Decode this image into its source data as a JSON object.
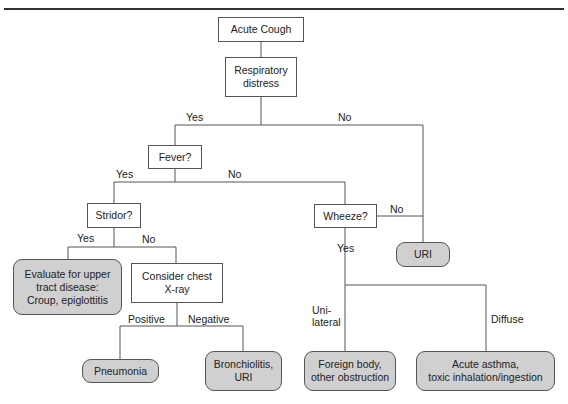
{
  "title": "Acute Cough",
  "nodes": {
    "acute_cough": "Acute Cough",
    "respiratory_distress": "Respiratory\ndistress",
    "fever": "Fever?",
    "stridor": "Stridor?",
    "wheeze": "Wheeze?",
    "uri": "URI",
    "evaluate_upper": "Evaluate for upper\ntract disease:\nCroup, epiglottitis",
    "consider_xray": "Consider chest\nX-ray",
    "pneumonia": "Pneumonia",
    "bronchiolitis": "Bronchiolitis,\nURI",
    "foreign_body": "Foreign body,\nother obstruction",
    "acute_asthma": "Acute asthma,\ntoxic inhalation/ingestion"
  },
  "edges": {
    "resp_yes": "Yes",
    "resp_no": "No",
    "fever_yes": "Yes",
    "fever_no": "No",
    "stridor_yes": "Yes",
    "stridor_no": "No",
    "wheeze_no": "No",
    "wheeze_yes": "Yes",
    "xray_positive": "Positive",
    "xray_negative": "Negative",
    "unilateral": "Uni-\nlateral",
    "diffuse": "Diffuse"
  },
  "colors": {
    "outcome_fill": "#d0d0d0",
    "line": "#555555",
    "rule": "#333333"
  }
}
